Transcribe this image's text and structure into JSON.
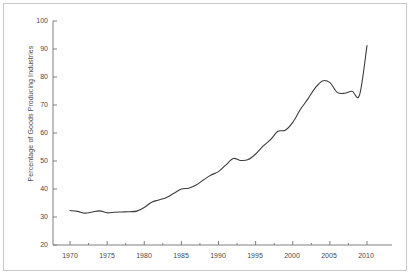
{
  "chart_data": {
    "type": "line",
    "title": "",
    "xlabel": "",
    "ylabel": "Percentage of Goods Producing Industries",
    "xlim": [
      1970,
      2012
    ],
    "ylim": [
      20,
      100
    ],
    "grid": false,
    "legend": null,
    "line_color": "#3c3c3c",
    "axis_color": "#808080",
    "tick_color": "#808080",
    "label_color": "#4a4a4a",
    "frame_color": "#c8c8c8",
    "background": "#ffffff",
    "y_ticks": [
      20,
      30,
      40,
      50,
      60,
      70,
      80,
      90,
      100
    ],
    "y_tick_labels": [
      "20",
      "30",
      "40",
      "50",
      "60",
      "70",
      "80",
      "90",
      "100"
    ],
    "x_ticks": [
      1970,
      1975,
      1980,
      1985,
      1990,
      1995,
      2000,
      2005,
      2010
    ],
    "x_tick_labels": [
      "1970",
      "1975",
      "1980",
      "1985",
      "1990",
      "1995",
      "2000",
      "2005",
      "2010"
    ],
    "x_minor_ticks": [
      1972.5,
      1977.5,
      1982.5,
      1987.5,
      1992.5,
      1997.5,
      2002.5,
      2007.5
    ],
    "series": [
      {
        "name": "Percentage of Goods Producing Industries",
        "x": [
          1970,
          1971,
          1972,
          1973,
          1974,
          1975,
          1976,
          1977,
          1978,
          1979,
          1980,
          1981,
          1982,
          1983,
          1984,
          1985,
          1986,
          1987,
          1988,
          1989,
          1990,
          1991,
          1992,
          1993,
          1994,
          1995,
          1996,
          1997,
          1998,
          1999,
          2000,
          2001,
          2002,
          2003,
          2004,
          2005,
          2006,
          2007,
          2008,
          2009,
          2010
        ],
        "y": [
          32.3,
          32.0,
          31.4,
          31.8,
          32.2,
          31.5,
          31.7,
          31.8,
          31.9,
          32.1,
          33.4,
          35.3,
          36.1,
          37.0,
          38.5,
          40.0,
          40.3,
          41.4,
          43.3,
          45.0,
          46.2,
          48.6,
          50.9,
          50.2,
          50.5,
          52.5,
          55.3,
          57.6,
          60.6,
          61.0,
          63.8,
          68.3,
          72.0,
          76.0,
          78.6,
          78.0,
          74.5,
          74.2,
          74.9,
          73.6,
          91.2
        ]
      }
    ]
  }
}
